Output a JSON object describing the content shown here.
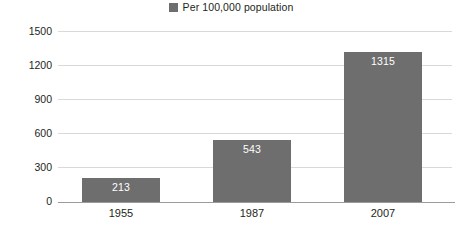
{
  "legend": {
    "marker_name": "legend-color-swatch",
    "label": "Per 100,000 population",
    "color": "#6e6e6e"
  },
  "axis": {
    "yticks": [
      "0",
      "300",
      "600",
      "900",
      "1200",
      "1500"
    ],
    "xticks": [
      "1955",
      "1987",
      "2007"
    ]
  },
  "chart_data": {
    "type": "bar",
    "title": "",
    "subtitle": "",
    "xlabel": "",
    "ylabel": "",
    "categories": [
      "1955",
      "1987",
      "2007"
    ],
    "values": [
      213,
      543,
      1315
    ],
    "data_labels": [
      "213",
      "543",
      "1315"
    ],
    "series": [
      {
        "name": "Per 100,000 population",
        "color": "#6e6e6e",
        "values": [
          213,
          543,
          1315
        ]
      }
    ],
    "ylim": [
      0,
      1500
    ],
    "ytick_values": [
      0,
      300,
      600,
      900,
      1200,
      1500
    ],
    "ytick_labels": [
      "0",
      "300",
      "600",
      "900",
      "1200",
      "1500"
    ],
    "grid": true,
    "grid_axis": "y",
    "grid_color": "#d9d9d9",
    "legend": true,
    "legend_position": "top-center",
    "bar_label_position": "inside-top",
    "bar_label_color": "#ffffff",
    "background": "#ffffff"
  }
}
